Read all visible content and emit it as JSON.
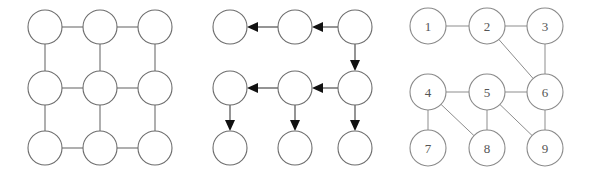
{
  "figure": {
    "background_color": "#ffffff",
    "stroke_color": "#6d6d6d",
    "label_color": "#555555",
    "arrow_color": "#111111",
    "width": 589,
    "height": 174
  },
  "panels": [
    {
      "id": "grid-undirected",
      "name": "undirected-grid-graph",
      "caption": "",
      "node_labels_visible": false,
      "directed": false,
      "node_radius": 17,
      "nodes": [
        {
          "id": "n1",
          "label": "",
          "cx": 45,
          "cy": 27
        },
        {
          "id": "n2",
          "label": "",
          "cx": 100,
          "cy": 27
        },
        {
          "id": "n3",
          "label": "",
          "cx": 155,
          "cy": 27
        },
        {
          "id": "n4",
          "label": "",
          "cx": 45,
          "cy": 88
        },
        {
          "id": "n5",
          "label": "",
          "cx": 100,
          "cy": 88
        },
        {
          "id": "n6",
          "label": "",
          "cx": 155,
          "cy": 88
        },
        {
          "id": "n7",
          "label": "",
          "cx": 45,
          "cy": 148
        },
        {
          "id": "n8",
          "label": "",
          "cx": 100,
          "cy": 148
        },
        {
          "id": "n9",
          "label": "",
          "cx": 155,
          "cy": 148
        }
      ],
      "edges": [
        {
          "from": "n1",
          "to": "n2"
        },
        {
          "from": "n2",
          "to": "n3"
        },
        {
          "from": "n4",
          "to": "n5"
        },
        {
          "from": "n5",
          "to": "n6"
        },
        {
          "from": "n7",
          "to": "n8"
        },
        {
          "from": "n8",
          "to": "n9"
        },
        {
          "from": "n1",
          "to": "n4"
        },
        {
          "from": "n2",
          "to": "n5"
        },
        {
          "from": "n3",
          "to": "n6"
        },
        {
          "from": "n4",
          "to": "n7"
        },
        {
          "from": "n5",
          "to": "n8"
        },
        {
          "from": "n6",
          "to": "n9"
        }
      ]
    },
    {
      "id": "grid-directed",
      "name": "directed-grid-graph",
      "caption": "",
      "node_labels_visible": false,
      "directed": true,
      "node_radius": 17,
      "nodes": [
        {
          "id": "d1",
          "label": "",
          "cx": 40,
          "cy": 27
        },
        {
          "id": "d2",
          "label": "",
          "cx": 105,
          "cy": 27
        },
        {
          "id": "d3",
          "label": "",
          "cx": 165,
          "cy": 27
        },
        {
          "id": "d4",
          "label": "",
          "cx": 40,
          "cy": 88
        },
        {
          "id": "d5",
          "label": "",
          "cx": 105,
          "cy": 88
        },
        {
          "id": "d6",
          "label": "",
          "cx": 165,
          "cy": 88
        },
        {
          "id": "d7",
          "label": "",
          "cx": 40,
          "cy": 148
        },
        {
          "id": "d8",
          "label": "",
          "cx": 105,
          "cy": 148
        },
        {
          "id": "d9",
          "label": "",
          "cx": 165,
          "cy": 148
        }
      ],
      "edges": [
        {
          "from": "d3",
          "to": "d2",
          "direction": "left"
        },
        {
          "from": "d2",
          "to": "d1",
          "direction": "left"
        },
        {
          "from": "d6",
          "to": "d5",
          "direction": "left"
        },
        {
          "from": "d5",
          "to": "d4",
          "direction": "left"
        },
        {
          "from": "d3",
          "to": "d6",
          "direction": "down"
        },
        {
          "from": "d4",
          "to": "d7",
          "direction": "down"
        },
        {
          "from": "d5",
          "to": "d8",
          "direction": "down"
        },
        {
          "from": "d6",
          "to": "d9",
          "direction": "down"
        }
      ]
    },
    {
      "id": "grid-labeled",
      "name": "numbered-graph",
      "caption": "",
      "node_labels_visible": true,
      "directed": false,
      "node_radius": 18,
      "nodes": [
        {
          "id": "l1",
          "label": "1",
          "cx": 38,
          "cy": 26
        },
        {
          "id": "l2",
          "label": "2",
          "cx": 97,
          "cy": 26
        },
        {
          "id": "l3",
          "label": "3",
          "cx": 155,
          "cy": 26
        },
        {
          "id": "l4",
          "label": "4",
          "cx": 38,
          "cy": 92
        },
        {
          "id": "l5",
          "label": "5",
          "cx": 97,
          "cy": 92
        },
        {
          "id": "l6",
          "label": "6",
          "cx": 155,
          "cy": 92
        },
        {
          "id": "l7",
          "label": "7",
          "cx": 38,
          "cy": 148
        },
        {
          "id": "l8",
          "label": "8",
          "cx": 97,
          "cy": 148
        },
        {
          "id": "l9",
          "label": "9",
          "cx": 155,
          "cy": 148
        }
      ],
      "edges": [
        {
          "from": "l1",
          "to": "l2"
        },
        {
          "from": "l2",
          "to": "l3"
        },
        {
          "from": "l2",
          "to": "l6"
        },
        {
          "from": "l3",
          "to": "l6"
        },
        {
          "from": "l4",
          "to": "l5"
        },
        {
          "from": "l5",
          "to": "l6"
        },
        {
          "from": "l4",
          "to": "l7"
        },
        {
          "from": "l4",
          "to": "l8"
        },
        {
          "from": "l5",
          "to": "l8"
        },
        {
          "from": "l5",
          "to": "l9"
        },
        {
          "from": "l6",
          "to": "l9"
        }
      ]
    }
  ]
}
